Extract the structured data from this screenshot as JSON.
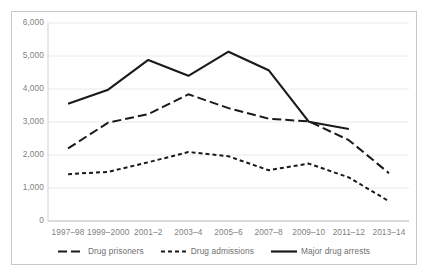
{
  "chart_data": {
    "type": "line",
    "title": "",
    "xlabel": "",
    "ylabel": "",
    "ylim": [
      0,
      6000
    ],
    "ytick_labels": [
      "0",
      "1,000",
      "2,000",
      "3,000",
      "4,000",
      "5,000",
      "6,000"
    ],
    "ytick_values": [
      0,
      1000,
      2000,
      3000,
      4000,
      5000,
      6000
    ],
    "grid": true,
    "legend_position": "bottom",
    "categories": [
      "1997–98",
      "1999–2000",
      "2001–2",
      "2003–4",
      "2005–6",
      "2007–8",
      "2009–10",
      "2011–12",
      "2013–14"
    ],
    "series": [
      {
        "name": "Drug prisoners",
        "style": "dashed-long",
        "color": "#1a1a1a",
        "values": [
          2200,
          2980,
          3240,
          3840,
          3420,
          3100,
          3020,
          2450,
          1450
        ]
      },
      {
        "name": "Drug admissions",
        "style": "dashed-short",
        "color": "#1a1a1a",
        "values": [
          1420,
          1490,
          1780,
          2090,
          1960,
          1540,
          1740,
          1320,
          600
        ]
      },
      {
        "name": "Major drug arrests",
        "style": "solid",
        "color": "#1a1a1a",
        "values": [
          3550,
          3980,
          4880,
          4400,
          5130,
          4570,
          3010,
          2790,
          null
        ]
      }
    ]
  },
  "legend": {
    "items": [
      {
        "label": "Drug prisoners",
        "style": "dashed-long"
      },
      {
        "label": "Drug admissions",
        "style": "dashed-short"
      },
      {
        "label": "Major drug arrests",
        "style": "solid"
      }
    ]
  },
  "frame": {
    "border_color": "#c8c8c8",
    "grid_color": "#eaeaea",
    "axis_color": "#d0d0d0",
    "tick_text_color": "#7f7f7f",
    "line_color": "#1a1a1a"
  }
}
